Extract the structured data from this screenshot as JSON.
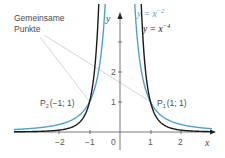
{
  "chart_data": {
    "type": "line",
    "title": "",
    "xlabel": "x",
    "ylabel": "y",
    "xlim": [
      -3.5,
      3
    ],
    "ylim": [
      0,
      3.9
    ],
    "x_ticks": [
      "-2",
      "-1",
      "0",
      "1",
      "2"
    ],
    "y_ticks": [
      "1",
      "2"
    ],
    "grid": false,
    "series": [
      {
        "name": "y = x^-2",
        "label_base": "y = x",
        "label_exp": "−2",
        "color": "#4fa3c9",
        "formula": "x^-2"
      },
      {
        "name": "y = x^-4",
        "label_base": "y = x",
        "label_exp": "−4",
        "color": "#1a1a1a",
        "formula": "x^-4"
      }
    ],
    "annotations": {
      "common_points_label_line1": "Gemeinsame",
      "common_points_label_line2": "Punkte",
      "points": [
        {
          "name": "P1",
          "letter": "P",
          "sub": "1",
          "coords": "(1; 1)",
          "x": 1,
          "y": 1
        },
        {
          "name": "P2",
          "letter": "P",
          "sub": "2",
          "coords": "(−1; 1)",
          "x": -1,
          "y": 1
        }
      ]
    }
  },
  "axes": {
    "x_label": "x",
    "y_label": "y",
    "x_tick_labels": [
      "−2",
      "−1",
      "0",
      "1",
      "2"
    ],
    "y_tick_labels": [
      "1",
      "2"
    ]
  },
  "colors": {
    "blue": "#4fa3c9",
    "black": "#1a1a1a",
    "axis": "#555555",
    "leader": "#c8c8c8"
  }
}
